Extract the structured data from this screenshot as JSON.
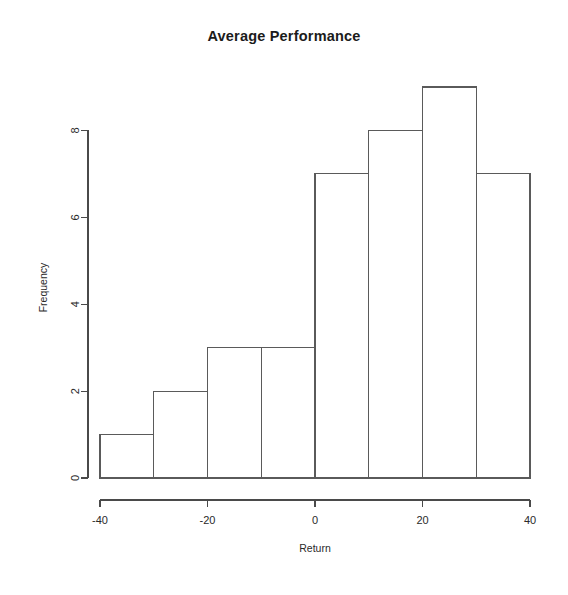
{
  "chart_data": {
    "type": "bar",
    "title": "Average Performance",
    "xlabel": "Return",
    "ylabel": "Frequency",
    "categories": [
      "-40 to -30",
      "-30 to -20",
      "-20 to -10",
      "-10 to 0",
      "0 to 10",
      "10 to 20",
      "20 to 30",
      "30 to 40"
    ],
    "bin_edges": [
      -40,
      -30,
      -20,
      -10,
      0,
      10,
      20,
      30,
      40
    ],
    "values": [
      1,
      2,
      3,
      3,
      7,
      8,
      9,
      7
    ],
    "xlim": [
      -40,
      40
    ],
    "ylim": [
      0,
      9
    ],
    "x_ticks": [
      -40,
      -20,
      0,
      20,
      40
    ],
    "x_tick_labels": [
      "-40",
      "-20",
      "0",
      "20",
      "40"
    ],
    "y_ticks": [
      0,
      2,
      4,
      6,
      8
    ],
    "y_tick_labels": [
      "0",
      "2",
      "4",
      "6",
      "8"
    ],
    "grid": false,
    "legend": false,
    "bar_fill": "#ffffff",
    "bar_stroke": "#5a5a5a",
    "axis_color": "#4a4a4a",
    "background": "#ffffff"
  }
}
